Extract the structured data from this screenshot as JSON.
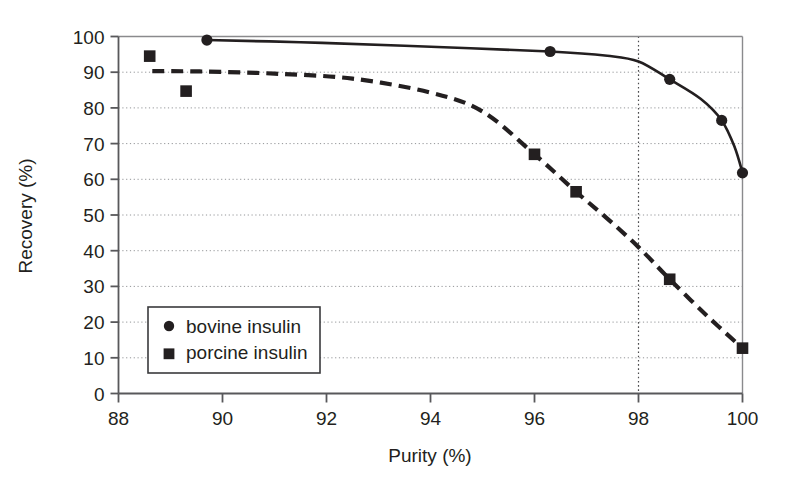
{
  "chart_data": {
    "type": "scatter",
    "title": "",
    "xlabel": "Purity (%)",
    "ylabel": "Recovery (%)",
    "xlim": [
      88,
      100
    ],
    "ylim": [
      0,
      100
    ],
    "xticks": [
      88,
      90,
      92,
      94,
      96,
      98,
      100
    ],
    "yticks": [
      0,
      10,
      20,
      30,
      40,
      50,
      60,
      70,
      80,
      90,
      100
    ],
    "xtick_labels": [
      "88",
      "90",
      "92",
      "94",
      "96",
      "98",
      "100"
    ],
    "ytick_labels": [
      "0",
      "10",
      "20",
      "30",
      "40",
      "50",
      "60",
      "70",
      "80",
      "90",
      "100"
    ],
    "grid": "horizontal-dotted",
    "legend_position": "lower-left-inside",
    "annotations": [
      {
        "name": "vertical-reference-line",
        "type": "vline",
        "x": 98,
        "style": "dotted"
      }
    ],
    "series": [
      {
        "name": "bovine insulin",
        "marker": "circle",
        "line_style": "solid",
        "color": "#231f20",
        "points": [
          {
            "x": 89.7,
            "y": 99.0
          },
          {
            "x": 96.3,
            "y": 95.8
          },
          {
            "x": 98.6,
            "y": 88.0
          },
          {
            "x": 99.6,
            "y": 76.5
          },
          {
            "x": 100.0,
            "y": 61.8
          }
        ],
        "curve": [
          {
            "x": 89.7,
            "y": 99.0
          },
          {
            "x": 91.5,
            "y": 98.4
          },
          {
            "x": 93.5,
            "y": 97.4
          },
          {
            "x": 96.3,
            "y": 95.8
          },
          {
            "x": 97.4,
            "y": 94.6
          },
          {
            "x": 98.0,
            "y": 93.0
          },
          {
            "x": 98.6,
            "y": 88.0
          },
          {
            "x": 99.2,
            "y": 82.5
          },
          {
            "x": 99.6,
            "y": 76.5
          },
          {
            "x": 99.85,
            "y": 69.0
          },
          {
            "x": 100.0,
            "y": 61.8
          }
        ]
      },
      {
        "name": "porcine insulin",
        "marker": "square",
        "line_style": "dashed",
        "color": "#231f20",
        "points": [
          {
            "x": 88.6,
            "y": 94.5
          },
          {
            "x": 89.3,
            "y": 84.7
          },
          {
            "x": 96.0,
            "y": 67.0
          },
          {
            "x": 96.8,
            "y": 56.5
          },
          {
            "x": 98.6,
            "y": 32.0
          },
          {
            "x": 100.0,
            "y": 12.7
          }
        ],
        "curve": [
          {
            "x": 88.65,
            "y": 90.3
          },
          {
            "x": 89.6,
            "y": 90.2
          },
          {
            "x": 91.0,
            "y": 89.6
          },
          {
            "x": 92.5,
            "y": 88.2
          },
          {
            "x": 94.0,
            "y": 84.3
          },
          {
            "x": 95.0,
            "y": 79.0
          },
          {
            "x": 96.0,
            "y": 67.0
          },
          {
            "x": 96.8,
            "y": 56.5
          },
          {
            "x": 97.4,
            "y": 49.0
          },
          {
            "x": 98.0,
            "y": 41.0
          },
          {
            "x": 98.6,
            "y": 32.0
          },
          {
            "x": 99.3,
            "y": 22.0
          },
          {
            "x": 100.0,
            "y": 12.7
          }
        ]
      }
    ]
  },
  "legend": {
    "items": [
      {
        "marker": "circle",
        "label": "bovine insulin"
      },
      {
        "marker": "square",
        "label": "porcine insulin"
      }
    ]
  },
  "colors": {
    "ink": "#231f20",
    "axis": "#58585b",
    "grid": "#939598",
    "background": "#ffffff"
  }
}
